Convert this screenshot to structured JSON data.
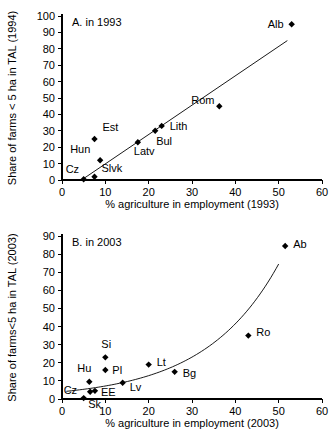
{
  "figure": {
    "width": 335,
    "height": 437,
    "background": "#ffffff",
    "ink_color": "#000000"
  },
  "chart_data": [
    {
      "type": "scatter",
      "id": "panel-a",
      "title": "A. in 1993",
      "xlabel": "% agriculture in employment (1993)",
      "ylabel": "Share of farms < 5 ha in TAL (1994)",
      "xlim": [
        0,
        60
      ],
      "ylim": [
        0,
        100
      ],
      "xticks": [
        0,
        10,
        20,
        30,
        40,
        50,
        60
      ],
      "yticks": [
        0,
        10,
        20,
        30,
        40,
        50,
        60,
        70,
        80,
        90,
        100
      ],
      "xtick_labels": [
        "0",
        "10",
        "20",
        "30",
        "40",
        "50",
        "60"
      ],
      "ytick_labels": [
        "0",
        "10",
        "20",
        "30",
        "40",
        "50",
        "60",
        "70",
        "80",
        "90",
        "100"
      ],
      "grid": false,
      "legend": "none",
      "marker": "diamond",
      "marker_color": "#000000",
      "points": [
        {
          "label": "Cz",
          "x": 5.0,
          "y": 0.5,
          "label_dx": -18,
          "label_dy": -6
        },
        {
          "label": "Slvk",
          "x": 7.5,
          "y": 2.0,
          "label_dx": 7,
          "label_dy": -5
        },
        {
          "label": "Hun",
          "x": 8.8,
          "y": 12.0,
          "label_dx": -30,
          "label_dy": -7
        },
        {
          "label": "Est",
          "x": 7.5,
          "y": 25.0,
          "label_dx": 8,
          "label_dy": -8
        },
        {
          "label": "Latv",
          "x": 17.5,
          "y": 23.0,
          "label_dx": -4,
          "label_dy": 13
        },
        {
          "label": "Bul",
          "x": 21.5,
          "y": 30.0,
          "label_dx": 1,
          "label_dy": 14
        },
        {
          "label": "Lith",
          "x": 23.0,
          "y": 33.0,
          "label_dx": 8,
          "label_dy": 4
        },
        {
          "label": "Rom",
          "x": 36.3,
          "y": 45.0,
          "label_dx": -28,
          "label_dy": -2
        },
        {
          "label": "Alb",
          "x": 53.0,
          "y": 95.0,
          "label_dx": -24,
          "label_dy": 4
        }
      ],
      "trendline": {
        "type": "linear",
        "x_start": 4.5,
        "y_start": 0.0,
        "x_end": 52.0,
        "y_end": 85.0
      }
    },
    {
      "type": "scatter",
      "id": "panel-b",
      "title": "B. in 2003",
      "xlabel": "% agriculture in employment (2003)",
      "ylabel": "Share of farms<5 ha in TAL (2003)",
      "xlim": [
        0,
        60
      ],
      "ylim": [
        0,
        90
      ],
      "xticks": [
        0,
        10,
        20,
        30,
        40,
        50,
        60
      ],
      "yticks": [
        0,
        10,
        20,
        30,
        40,
        50,
        60,
        70,
        80,
        90
      ],
      "xtick_labels": [
        "0",
        "10",
        "20",
        "30",
        "40",
        "50",
        "60"
      ],
      "ytick_labels": [
        "0",
        "10",
        "20",
        "30",
        "40",
        "50",
        "60",
        "70",
        "80",
        "90"
      ],
      "grid": false,
      "legend": "none",
      "marker": "diamond",
      "marker_color": "#000000",
      "points": [
        {
          "label": "Cz",
          "x": 5.0,
          "y": 0.5,
          "label_dx": -20,
          "label_dy": -4
        },
        {
          "label": "Sk",
          "x": 6.5,
          "y": 4.0,
          "label_dx": -2,
          "label_dy": 16
        },
        {
          "label": "EE",
          "x": 7.6,
          "y": 4.5,
          "label_dx": 6,
          "label_dy": 5
        },
        {
          "label": "Hu",
          "x": 6.3,
          "y": 9.5,
          "label_dx": -12,
          "label_dy": -10
        },
        {
          "label": "Pl",
          "x": 10.0,
          "y": 16.0,
          "label_dx": 7,
          "label_dy": 4
        },
        {
          "label": "Si",
          "x": 10.0,
          "y": 23.0,
          "label_dx": -4,
          "label_dy": -9
        },
        {
          "label": "Lv",
          "x": 14.0,
          "y": 9.0,
          "label_dx": 7,
          "label_dy": 8
        },
        {
          "label": "Lt",
          "x": 20.0,
          "y": 19.0,
          "label_dx": 8,
          "label_dy": 1
        },
        {
          "label": "Bg",
          "x": 26.0,
          "y": 15.0,
          "label_dx": 8,
          "label_dy": 5
        },
        {
          "label": "Ro",
          "x": 43.0,
          "y": 35.0,
          "label_dx": 8,
          "label_dy": 0
        },
        {
          "label": "Ab",
          "x": 51.5,
          "y": 84.5,
          "label_dx": 8,
          "label_dy": 2
        }
      ],
      "trendline": {
        "type": "exponential",
        "x_start": 1.0,
        "x_end": 50.0,
        "a": 4.0,
        "b": 0.0585
      }
    }
  ]
}
